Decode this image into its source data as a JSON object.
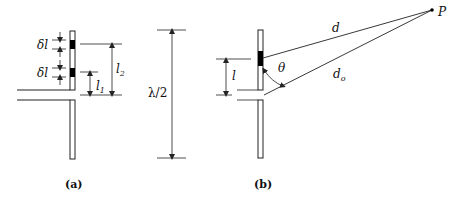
{
  "figure": {
    "panel_a": {
      "caption": "(a)",
      "delta_label_1": "δl",
      "delta_label_2": "δl",
      "l1_label": "l",
      "l1_sub": "1",
      "l2_label": "l",
      "l2_sub": "2"
    },
    "half_wave": {
      "label": "λ/2"
    },
    "panel_b": {
      "caption": "(b)",
      "l_label": "l",
      "theta_label": "θ",
      "d_label": "d",
      "do_label": "d",
      "do_sub": "o",
      "point_label": "P"
    },
    "colors": {
      "stroke": "#222222",
      "fill_segment": "#000000",
      "background": "#ffffff"
    }
  }
}
